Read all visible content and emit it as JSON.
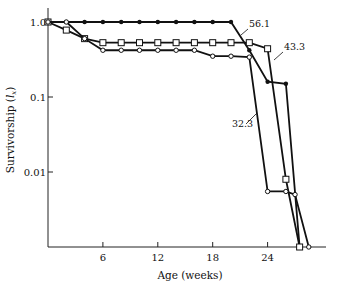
{
  "chart_data": {
    "type": "line",
    "title": "",
    "xlabel": "Age (weeks)",
    "ylabel": "Survivorship (l_x)",
    "ylabel_main": "Survivorship (",
    "ylabel_sym": "l",
    "ylabel_sub": "x",
    "ylabel_close": ")",
    "yscale": "log",
    "xlim": [
      0,
      29
    ],
    "ylim": [
      0.001,
      1.3
    ],
    "x_ticks": [
      6,
      12,
      18,
      24
    ],
    "x_tick_labels": [
      "6",
      "12",
      "18",
      "24"
    ],
    "y_ticks": [
      1.0,
      0.1,
      0.01
    ],
    "y_tick_labels": [
      "1.0",
      "0.1",
      "0.01"
    ],
    "grid": false,
    "legend": "none",
    "series": [
      {
        "name": "56.1",
        "marker": "filled-circle",
        "x": [
          0,
          2,
          4,
          6,
          8,
          10,
          12,
          14,
          16,
          18,
          20,
          22,
          24,
          26,
          27.5
        ],
        "y": [
          1.0,
          1.0,
          1.0,
          1.0,
          1.0,
          1.0,
          1.0,
          1.0,
          1.0,
          1.0,
          1.0,
          0.42,
          0.16,
          0.15,
          0.001
        ]
      },
      {
        "name": "43.3",
        "marker": "open-square",
        "x": [
          0,
          2,
          4,
          6,
          8,
          10,
          12,
          14,
          16,
          18,
          20,
          22,
          24,
          26,
          27.5
        ],
        "y": [
          1.0,
          0.78,
          0.6,
          0.53,
          0.53,
          0.53,
          0.53,
          0.53,
          0.53,
          0.53,
          0.53,
          0.53,
          0.44,
          0.008,
          0.001
        ]
      },
      {
        "name": "32.3",
        "marker": "open-circle",
        "x": [
          0,
          2,
          4,
          6,
          8,
          10,
          12,
          14,
          16,
          18,
          20,
          22,
          24,
          26,
          27,
          28.5
        ],
        "y": [
          1.0,
          1.0,
          0.6,
          0.42,
          0.42,
          0.42,
          0.42,
          0.42,
          0.42,
          0.35,
          0.35,
          0.34,
          0.0055,
          0.0055,
          0.005,
          0.001
        ]
      }
    ],
    "annotations": [
      {
        "text": "56.1",
        "series": "56.1"
      },
      {
        "text": "43.3",
        "series": "43.3"
      },
      {
        "text": "32.3",
        "series": "32.3"
      }
    ]
  }
}
